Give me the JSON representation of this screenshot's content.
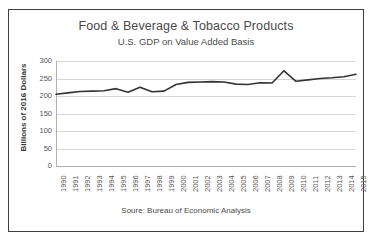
{
  "chart_data": {
    "type": "line",
    "title": "Food & Beverage & Tobacco Products",
    "subtitle": "U.S. GDP on Value Added Basis",
    "xlabel": "",
    "ylabel": "Billions of 2016 Dollars",
    "source_note": "Soure: Bureau of Economic Analysis",
    "ylim": [
      0,
      300
    ],
    "yticks": [
      0,
      50,
      100,
      150,
      200,
      250,
      300
    ],
    "grid": true,
    "legend": false,
    "line_color": "#333333",
    "categories": [
      "1990",
      "1991",
      "1992",
      "1993",
      "1994",
      "1995",
      "1996",
      "1997",
      "1998",
      "1999",
      "2000",
      "2001",
      "2002",
      "2003",
      "2004",
      "2005",
      "2006",
      "2007",
      "2008",
      "2009",
      "2010",
      "2011",
      "2012",
      "2013",
      "2014",
      "2015"
    ],
    "values": [
      205,
      209,
      213,
      214,
      215,
      221,
      211,
      225,
      212,
      214,
      233,
      239,
      240,
      241,
      240,
      234,
      233,
      238,
      237,
      272,
      242,
      246,
      250,
      252,
      255,
      262
    ],
    "series_name": "Real Value Added"
  }
}
